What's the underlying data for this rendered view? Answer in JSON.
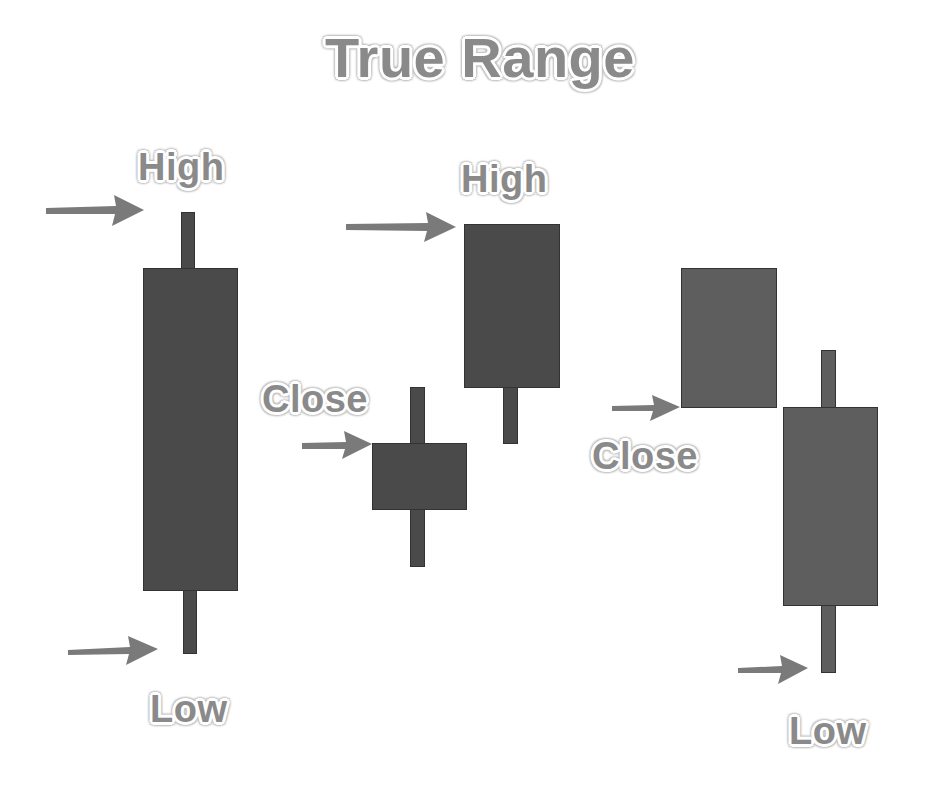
{
  "title": "True Range",
  "colors": {
    "candle_dark": "#4a4a4a",
    "candle_light": "#5e5e5e",
    "candle_border": "#333333",
    "arrow": "#7a7a7a",
    "label_fill": "#8a8a8a",
    "background": "#ffffff"
  },
  "labels": {
    "high_left": "High",
    "low_left": "Low",
    "close_middle": "Close",
    "high_middle": "High",
    "close_right": "Close",
    "low_right": "Low"
  },
  "candles": [
    {
      "id": "candle-1",
      "description": "tall candle with high and low marked",
      "annotations": [
        "High",
        "Low"
      ]
    },
    {
      "id": "candle-2",
      "description": "small candle with close marked",
      "annotations": [
        "Close"
      ]
    },
    {
      "id": "candle-3",
      "description": "next candle with high marked (gap up)",
      "annotations": [
        "High"
      ]
    },
    {
      "id": "candle-4",
      "description": "candle with close marked",
      "annotations": [
        "Close"
      ]
    },
    {
      "id": "candle-5",
      "description": "next candle with low marked (gap down)",
      "annotations": [
        "Low"
      ]
    }
  ],
  "icons": {
    "arrow": "arrow-right-icon"
  }
}
